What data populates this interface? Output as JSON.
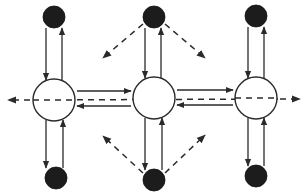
{
  "diagram": {
    "type": "network-flow",
    "colors": {
      "stroke": "#2a2a2a",
      "dark_node": "#1c1c1c",
      "open_node": "#ffffff",
      "background": "#ffffff"
    },
    "open_nodes": [
      {
        "id": "hub-left",
        "cx": 54,
        "cy": 100,
        "r": 21
      },
      {
        "id": "hub-center",
        "cx": 154,
        "cy": 98,
        "r": 21
      },
      {
        "id": "hub-right",
        "cx": 256,
        "cy": 98,
        "r": 21
      }
    ],
    "dark_nodes": [
      {
        "id": "top-left",
        "cx": 54,
        "cy": 17,
        "r": 11
      },
      {
        "id": "top-center",
        "cx": 154,
        "cy": 17,
        "r": 11
      },
      {
        "id": "top-right",
        "cx": 256,
        "cy": 16,
        "r": 11
      },
      {
        "id": "bottom-left",
        "cx": 56,
        "cy": 178,
        "r": 11
      },
      {
        "id": "bottom-center",
        "cx": 154,
        "cy": 180,
        "r": 11
      },
      {
        "id": "bottom-right",
        "cx": 256,
        "cy": 176,
        "r": 11
      }
    ],
    "edges": {
      "solid_vertical": [
        {
          "from": "top-left",
          "to": "hub-left"
        },
        {
          "from": "hub-left",
          "to": "top-left"
        },
        {
          "from": "top-center",
          "to": "hub-center"
        },
        {
          "from": "hub-center",
          "to": "top-center"
        },
        {
          "from": "top-right",
          "to": "hub-right"
        },
        {
          "from": "hub-right",
          "to": "top-right"
        },
        {
          "from": "hub-left",
          "to": "bottom-left"
        },
        {
          "from": "bottom-left",
          "to": "hub-left"
        },
        {
          "from": "hub-center",
          "to": "bottom-center"
        },
        {
          "from": "bottom-center",
          "to": "hub-center"
        },
        {
          "from": "hub-right",
          "to": "bottom-right"
        },
        {
          "from": "bottom-right",
          "to": "hub-right"
        }
      ],
      "solid_horizontal": [
        {
          "from": "hub-left",
          "to": "hub-center"
        },
        {
          "from": "hub-center",
          "to": "hub-left"
        },
        {
          "from": "hub-center",
          "to": "hub-right"
        },
        {
          "from": "hub-right",
          "to": "hub-center"
        }
      ],
      "dashed": [
        {
          "from": "hub-right",
          "to": "exit-right",
          "style": "dashed"
        },
        {
          "from": "hub-left",
          "to": "exit-left",
          "style": "dashed"
        },
        {
          "from": "top-center",
          "to": "down-left",
          "style": "dashed"
        },
        {
          "from": "top-center",
          "to": "down-right",
          "style": "dashed"
        },
        {
          "from": "bottom-center",
          "to": "up-left",
          "style": "dashed"
        },
        {
          "from": "bottom-center",
          "to": "up-right",
          "style": "dashed"
        }
      ]
    }
  }
}
